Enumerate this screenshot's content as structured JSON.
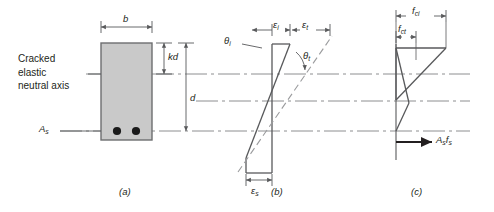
{
  "figure": {
    "background": "#ffffff",
    "ink": "#231f20",
    "line_color": "#58595b",
    "section_fill": "#c9c9c9",
    "section_stroke": "#6d6e70",
    "rebar_color": "#1a1a1a",
    "axis_color": "#8d8e90"
  },
  "panel_a": {
    "caption": "(a)",
    "note_line1": "Cracked",
    "note_line2": "elastic",
    "note_line3": "neutral axis",
    "width_label": "b",
    "depth_to_na_label": "kd",
    "effective_depth_label": "d",
    "steel_area_label": "A",
    "steel_area_sub": "s",
    "rebar_count": 2
  },
  "panel_b": {
    "caption": "(b)",
    "strain_initial": "ε",
    "strain_initial_sub": "i",
    "strain_total": "ε",
    "strain_total_sub": "t",
    "strain_steel": "ε",
    "strain_steel_sub": "s",
    "angle_initial": "θ",
    "angle_initial_sub": "i",
    "angle_total": "θ",
    "angle_total_sub": "t"
  },
  "panel_c": {
    "caption": "(c)",
    "stress_ci": "f",
    "stress_ci_sub": "ci",
    "stress_ct": "f",
    "stress_ct_sub": "ct",
    "steel_force": "A",
    "steel_force_sub1": "s",
    "steel_force_2": "f",
    "steel_force_sub2": "s"
  }
}
